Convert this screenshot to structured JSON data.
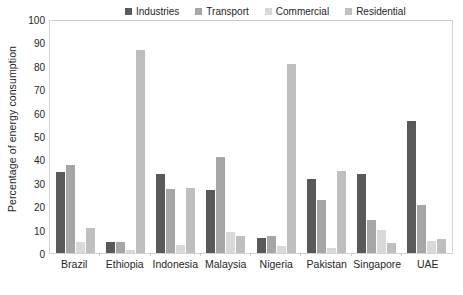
{
  "chart_data": {
    "type": "bar",
    "title": "",
    "subtitle": "",
    "xlabel": "",
    "ylabel": "Percentage of energy consumption",
    "ylim": [
      0,
      100
    ],
    "yticks": [
      0,
      10,
      20,
      30,
      40,
      50,
      60,
      70,
      80,
      90,
      100
    ],
    "grid": false,
    "legend_position": "top-center",
    "categories": [
      "Brazil",
      "Ethiopia",
      "Indonesia",
      "Malaysia",
      "Nigeria",
      "Pakistan",
      "Singapore",
      "UAE"
    ],
    "series": [
      {
        "name": "Industries",
        "color": "#595959",
        "values": [
          35.0,
          4.6,
          34.2,
          27.0,
          6.5,
          31.7,
          34.2,
          56.8
        ]
      },
      {
        "name": "Transport",
        "color": "#a6a6a6",
        "values": [
          37.9,
          4.9,
          27.4,
          41.3,
          7.2,
          22.9,
          14.3,
          20.6
        ]
      },
      {
        "name": "Commercial",
        "color": "#d9d9d9",
        "values": [
          4.9,
          1.5,
          3.4,
          9.0,
          3.0,
          2.1,
          10.1,
          5.2
        ]
      },
      {
        "name": "Residential",
        "color": "#bfbfbf",
        "values": [
          10.8,
          87.5,
          27.9,
          7.5,
          81.4,
          35.5,
          4.5,
          5.9
        ]
      }
    ]
  },
  "axis": {
    "y_title": "Percentage of energy consumption",
    "tick_labels": [
      "100",
      "90",
      "80",
      "70",
      "60",
      "50",
      "40",
      "30",
      "20",
      "10",
      "0"
    ]
  },
  "legend": {
    "items": [
      {
        "label": "Industries",
        "color": "#595959"
      },
      {
        "label": "Transport",
        "color": "#a6a6a6"
      },
      {
        "label": "Commercial",
        "color": "#d9d9d9"
      },
      {
        "label": "Residential",
        "color": "#bfbfbf"
      }
    ]
  },
  "colors": {
    "industries": "#595959",
    "transport": "#a6a6a6",
    "commercial": "#d9d9d9",
    "residential": "#bfbfbf",
    "plot_border": "#d3d3d3",
    "text": "#262626",
    "background": "#ffffff"
  }
}
